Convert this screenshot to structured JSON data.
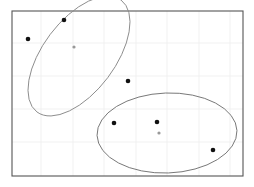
{
  "chart_data": {
    "type": "scatter",
    "title": "",
    "subtitle": "",
    "xlabel": "",
    "ylabel": "",
    "xlim": [
      0,
      1
    ],
    "ylim": [
      0,
      1
    ],
    "grid": true,
    "grid_color": "#eeeeee",
    "frame_color": "#555555",
    "background": "#ffffff",
    "legend": null,
    "xticks": [],
    "yticks": [],
    "x_gridlines_px": [
      41,
      73,
      104,
      136,
      167,
      199,
      230
    ],
    "y_gridlines_px": [
      43,
      76,
      109,
      142
    ],
    "frame_px": {
      "x0": 12,
      "y0": 11,
      "x1": 243,
      "y1": 176
    },
    "series": [
      {
        "name": "observed",
        "marker": "filled-circle",
        "color": "#111111",
        "size_px": 4.6,
        "points_px": [
          {
            "x": 28,
            "y": 39
          },
          {
            "x": 64,
            "y": 20
          },
          {
            "x": 128,
            "y": 81
          },
          {
            "x": 114,
            "y": 123
          },
          {
            "x": 157,
            "y": 122
          },
          {
            "x": 213,
            "y": 150
          }
        ]
      },
      {
        "name": "centroid",
        "marker": "filled-circle",
        "color": "#999999",
        "size_px": 3.2,
        "points_px": [
          {
            "x": 74,
            "y": 47
          },
          {
            "x": 159,
            "y": 133
          }
        ]
      }
    ],
    "ellipses": [
      {
        "name": "cluster-1-ellipse",
        "cx": 79,
        "cy": 56,
        "rx": 70,
        "ry": 36,
        "rotation_deg": -53,
        "stroke": "#8c8c8c",
        "stroke_width": 0.9,
        "fill": "none"
      },
      {
        "name": "cluster-2-ellipse",
        "cx": 167,
        "cy": 133,
        "rx": 70,
        "ry": 40,
        "rotation_deg": -2,
        "stroke": "#6b6b6b",
        "stroke_width": 0.9,
        "fill": "none"
      }
    ]
  },
  "figure": {
    "width": 254,
    "height": 187,
    "caption": ""
  }
}
